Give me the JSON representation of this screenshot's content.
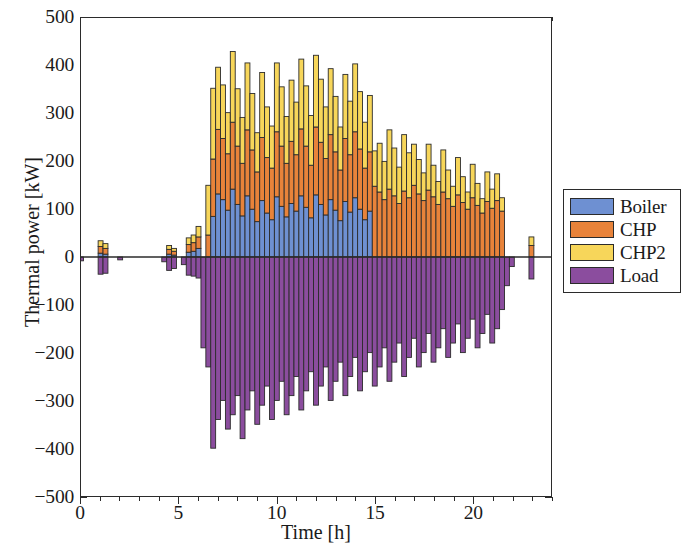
{
  "chart_data": {
    "type": "bar",
    "subtype": "stacked-bar-positive-negative",
    "title": "",
    "xlabel": "Time [h]",
    "ylabel": "Thermal power [kW]",
    "xlim": [
      0,
      24
    ],
    "ylim": [
      -500,
      500
    ],
    "xticks": [
      0,
      5,
      10,
      15,
      20
    ],
    "xtick_labels": [
      "0",
      "5",
      "10",
      "15",
      "20"
    ],
    "yticks": [
      -500,
      -400,
      -300,
      -200,
      -100,
      0,
      100,
      200,
      300,
      400,
      500
    ],
    "ytick_labels": [
      "−500",
      "−400",
      "−300",
      "−200",
      "−100",
      "0",
      "100",
      "200",
      "300",
      "400",
      "500"
    ],
    "grid": false,
    "legend_position": "right-outside",
    "bar_width_hours": 0.25,
    "bar_edge_color": "#2b2b2b",
    "x": [
      0.0,
      0.25,
      0.5,
      0.75,
      1.0,
      1.25,
      1.5,
      1.75,
      2.0,
      2.25,
      2.5,
      2.75,
      3.0,
      3.25,
      3.5,
      3.75,
      4.0,
      4.25,
      4.5,
      4.75,
      5.0,
      5.25,
      5.5,
      5.75,
      6.0,
      6.25,
      6.5,
      6.75,
      7.0,
      7.25,
      7.5,
      7.75,
      8.0,
      8.25,
      8.5,
      8.75,
      9.0,
      9.25,
      9.5,
      9.75,
      10.0,
      10.25,
      10.5,
      10.75,
      11.0,
      11.25,
      11.5,
      11.75,
      12.0,
      12.25,
      12.5,
      12.75,
      13.0,
      13.25,
      13.5,
      13.75,
      14.0,
      14.25,
      14.5,
      14.75,
      15.0,
      15.25,
      15.5,
      15.75,
      16.0,
      16.25,
      16.5,
      16.75,
      17.0,
      17.25,
      17.5,
      17.75,
      18.0,
      18.25,
      18.5,
      18.75,
      19.0,
      19.25,
      19.5,
      19.75,
      20.0,
      20.25,
      20.5,
      20.75,
      21.0,
      21.25,
      21.5,
      21.75,
      22.0,
      22.25,
      22.5,
      22.75,
      23.0,
      23.25,
      23.5,
      23.75
    ],
    "series": [
      {
        "name": "Boiler",
        "color": "#6e90d2",
        "values": [
          0,
          0,
          0,
          0,
          8,
          6,
          0,
          0,
          0,
          0,
          0,
          0,
          0,
          0,
          0,
          0,
          0,
          0,
          6,
          4,
          0,
          0,
          10,
          12,
          18,
          0,
          0,
          85,
          132,
          120,
          98,
          142,
          110,
          86,
          128,
          100,
          74,
          118,
          92,
          78,
          126,
          106,
          84,
          112,
          96,
          128,
          104,
          82,
          130,
          110,
          88,
          120,
          98,
          76,
          116,
          94,
          124,
          100,
          78,
          96,
          0,
          0,
          0,
          0,
          0,
          0,
          0,
          0,
          0,
          0,
          0,
          0,
          0,
          0,
          0,
          0,
          0,
          0,
          0,
          0,
          0,
          0,
          0,
          0,
          0,
          0,
          0,
          0,
          0,
          0,
          0,
          0,
          0,
          0,
          0,
          0
        ]
      },
      {
        "name": "CHP",
        "color": "#e8833a",
        "values": [
          0,
          0,
          0,
          0,
          14,
          12,
          0,
          0,
          0,
          0,
          0,
          0,
          0,
          0,
          0,
          0,
          0,
          0,
          10,
          8,
          0,
          0,
          16,
          18,
          24,
          0,
          46,
          120,
          135,
          128,
          118,
          140,
          122,
          110,
          138,
          124,
          104,
          132,
          116,
          108,
          136,
          126,
          112,
          130,
          118,
          140,
          128,
          110,
          142,
          130,
          118,
          136,
          122,
          106,
          132,
          120,
          138,
          126,
          108,
          124,
          148,
          136,
          120,
          142,
          128,
          112,
          138,
          124,
          150,
          132,
          118,
          140,
          126,
          110,
          136,
          122,
          106,
          130,
          114,
          100,
          124,
          108,
          92,
          116,
          102,
          118,
          96,
          0,
          0,
          0,
          0,
          0,
          24,
          0,
          0,
          0
        ]
      },
      {
        "name": "CHP2",
        "color": "#f7d65a",
        "values": [
          0,
          0,
          0,
          0,
          12,
          10,
          0,
          0,
          0,
          0,
          0,
          0,
          0,
          0,
          0,
          0,
          0,
          0,
          8,
          6,
          0,
          0,
          14,
          16,
          22,
          0,
          104,
          148,
          130,
          112,
          86,
          148,
          120,
          96,
          140,
          118,
          82,
          136,
          106,
          88,
          144,
          124,
          98,
          128,
          110,
          146,
          126,
          104,
          150,
          132,
          108,
          138,
          116,
          90,
          134,
          112,
          142,
          120,
          96,
          118,
          74,
          102,
          80,
          124,
          100,
          76,
          118,
          94,
          86,
          72,
          58,
          96,
          66,
          48,
          88,
          60,
          42,
          78,
          54,
          36,
          70,
          46,
          30,
          62,
          40,
          56,
          28,
          0,
          0,
          0,
          0,
          0,
          18,
          0,
          0,
          0
        ]
      },
      {
        "name": "Load",
        "color": "#8b4d9e",
        "values": [
          -8,
          0,
          0,
          0,
          -36,
          -34,
          0,
          0,
          -6,
          0,
          0,
          0,
          0,
          0,
          0,
          0,
          0,
          -10,
          -28,
          -24,
          0,
          -16,
          -38,
          -40,
          -44,
          -190,
          -230,
          -400,
          -340,
          -300,
          -360,
          -330,
          -290,
          -380,
          -320,
          -280,
          -350,
          -310,
          -270,
          -340,
          -300,
          -260,
          -330,
          -290,
          -250,
          -320,
          -280,
          -240,
          -310,
          -270,
          -230,
          -300,
          -260,
          -220,
          -290,
          -250,
          -210,
          -280,
          -240,
          -200,
          -270,
          -230,
          -190,
          -260,
          -220,
          -180,
          -250,
          -210,
          -170,
          -230,
          -200,
          -160,
          -220,
          -190,
          -150,
          -210,
          -180,
          -140,
          -200,
          -170,
          -130,
          -190,
          -160,
          -120,
          -180,
          -150,
          -110,
          -60,
          -20,
          0,
          0,
          0,
          -46,
          0,
          0,
          0
        ]
      }
    ]
  },
  "axes": {
    "xlabel": "Time [h]",
    "ylabel": "Thermal power [kW]",
    "xtick_labels": [
      "0",
      "5",
      "10",
      "15",
      "20"
    ],
    "ytick_labels": [
      "500",
      "400",
      "300",
      "200",
      "100",
      "0",
      "−100",
      "−200",
      "−300",
      "−400",
      "−500"
    ]
  },
  "legend": {
    "items": [
      {
        "label": "Boiler",
        "color": "#6e90d2"
      },
      {
        "label": "CHP",
        "color": "#e8833a"
      },
      {
        "label": "CHP2",
        "color": "#f7d65a"
      },
      {
        "label": "Load",
        "color": "#8b4d9e"
      }
    ]
  }
}
